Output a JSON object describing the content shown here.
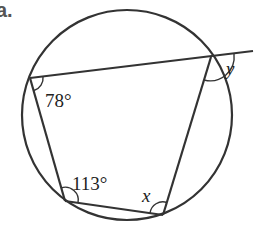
{
  "part_label": "a.",
  "diagram": {
    "type": "cyclic-quadrilateral",
    "circle": {
      "cx": 127,
      "cy": 115,
      "r": 105
    },
    "vertices": {
      "top_left": [
        30,
        78
      ],
      "top_right": [
        211,
        57
      ],
      "bottom_right": [
        163,
        215
      ],
      "bottom_left": [
        65,
        201
      ]
    },
    "extended_line_end": [
      253,
      51
    ],
    "angles": {
      "top_left": "78°",
      "bottom_left": "113°",
      "bottom_right": "x",
      "exterior_top_right": "y"
    },
    "stroke_color": "#333333"
  }
}
